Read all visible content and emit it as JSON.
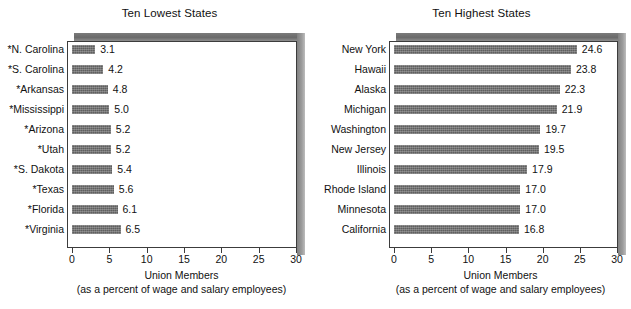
{
  "chart_data": [
    {
      "type": "bar",
      "orientation": "horizontal",
      "title": "Ten Lowest States",
      "panel": "left",
      "xlabel": "Union Members",
      "xsublabel": "(as a percent of wage and salary employees)",
      "ylabel": "",
      "xlim": [
        0,
        30
      ],
      "xticks": [
        0,
        5,
        10,
        15,
        20,
        25,
        30
      ],
      "xtick_labels": [
        "0",
        "5",
        "10",
        "15",
        "20",
        "25",
        "30"
      ],
      "grid": false,
      "legend": false,
      "bar_color": "#5f5f5f",
      "categories": [
        "*N. Carolina",
        "*S. Carolina",
        "*Arkansas",
        "*Mississippi",
        "*Arizona",
        "*Utah",
        "*S. Dakota",
        "*Texas",
        "*Florida",
        "*Virginia"
      ],
      "values": [
        3.1,
        4.2,
        4.8,
        5.0,
        5.2,
        5.2,
        5.4,
        5.6,
        6.1,
        6.5
      ],
      "value_labels": [
        "3.1",
        "4.2",
        "4.8",
        "5.0",
        "5.2",
        "5.2",
        "5.4",
        "5.6",
        "6.1",
        "6.5"
      ]
    },
    {
      "type": "bar",
      "orientation": "horizontal",
      "title": "Ten Highest States",
      "panel": "right",
      "xlabel": "Union Members",
      "xsublabel": "(as a percent of wage and salary employees)",
      "ylabel": "",
      "xlim": [
        0,
        30
      ],
      "xticks": [
        0,
        5,
        10,
        15,
        20,
        25,
        30
      ],
      "xtick_labels": [
        "0",
        "5",
        "10",
        "15",
        "20",
        "25",
        "30"
      ],
      "grid": false,
      "legend": false,
      "bar_color": "#5f5f5f",
      "categories": [
        "New York",
        "Hawaii",
        "Alaska",
        "Michigan",
        "Washington",
        "New Jersey",
        "Illinois",
        "Rhode Island",
        "Minnesota",
        "California"
      ],
      "values": [
        24.6,
        23.8,
        22.3,
        21.9,
        19.7,
        19.5,
        17.9,
        17.0,
        17.0,
        16.8
      ],
      "value_labels": [
        "24.6",
        "23.8",
        "22.3",
        "21.9",
        "19.7",
        "19.5",
        "17.9",
        "17.0",
        "17.0",
        "16.8"
      ]
    }
  ]
}
